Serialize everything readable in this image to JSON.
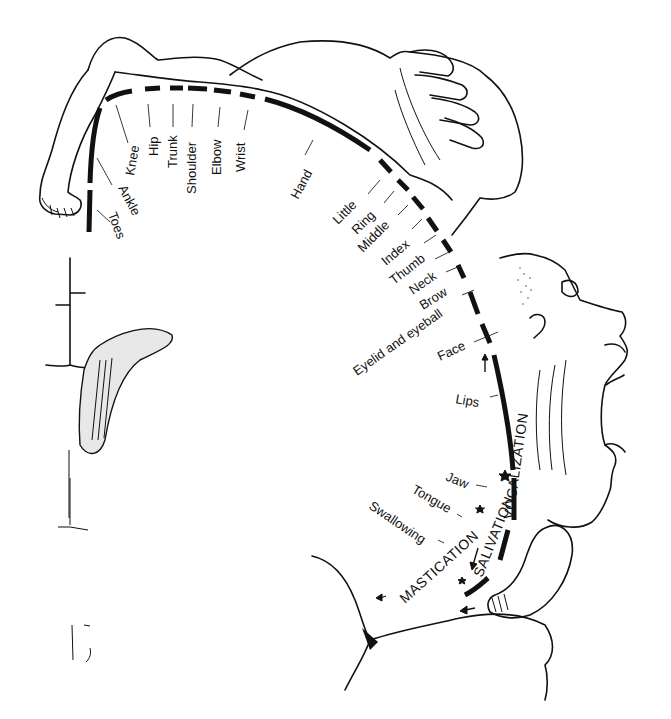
{
  "figure": {
    "colors": {
      "ink": "#111111",
      "background": "#ffffff"
    },
    "body_part_labels": [
      {
        "id": "toes",
        "text": "Toes",
        "x": 118,
        "y": 232,
        "rot": 70
      },
      {
        "id": "ankle",
        "text": "Ankle",
        "x": 130,
        "y": 200,
        "rot": 62
      },
      {
        "id": "knee",
        "text": "Knee",
        "x": 108,
        "y": 160,
        "rot": -80
      },
      {
        "id": "hip",
        "text": "Hip",
        "x": 152,
        "y": 158,
        "rot": -90
      },
      {
        "id": "trunk",
        "text": "Trunk",
        "x": 168,
        "y": 170,
        "rot": -90
      },
      {
        "id": "shoulder",
        "text": "Shoulder",
        "x": 190,
        "y": 190,
        "rot": -90
      },
      {
        "id": "elbow",
        "text": "Elbow",
        "x": 212,
        "y": 175,
        "rot": -90
      },
      {
        "id": "wrist",
        "text": "Wrist",
        "x": 238,
        "y": 170,
        "rot": -90
      },
      {
        "id": "hand",
        "text": "Hand",
        "x": 298,
        "y": 196,
        "rot": -62
      },
      {
        "id": "little",
        "text": "Little",
        "x": 342,
        "y": 224,
        "rot": -45
      },
      {
        "id": "ring",
        "text": "Ring",
        "x": 360,
        "y": 234,
        "rot": -45
      },
      {
        "id": "middle",
        "text": "Middle",
        "x": 368,
        "y": 253,
        "rot": -45
      },
      {
        "id": "index",
        "text": "Index",
        "x": 391,
        "y": 265,
        "rot": -40
      },
      {
        "id": "thumb",
        "text": "Thumb",
        "x": 397,
        "y": 285,
        "rot": -38
      },
      {
        "id": "neck",
        "text": "Neck",
        "x": 417,
        "y": 295,
        "rot": -35
      },
      {
        "id": "brow",
        "text": "Brow",
        "x": 426,
        "y": 310,
        "rot": -32
      },
      {
        "id": "eyelid",
        "text": "Eyelid and eyeball",
        "x": 362,
        "y": 374,
        "rot": -35
      },
      {
        "id": "face",
        "text": "Face",
        "x": 440,
        "y": 360,
        "rot": -25
      },
      {
        "id": "lips",
        "text": "Lips",
        "x": 455,
        "y": 408,
        "rot": 10
      },
      {
        "id": "jaw",
        "text": "Jaw",
        "x": 443,
        "y": 482,
        "rot": 22
      },
      {
        "id": "tongue",
        "text": "Tongue",
        "x": 410,
        "y": 492,
        "rot": 30
      },
      {
        "id": "swallowing",
        "text": "Swallowing",
        "x": 369,
        "y": 510,
        "rot": 34
      }
    ],
    "function_labels": [
      {
        "id": "vocalization",
        "text": "VOCALIZATION",
        "x": 514,
        "y": 512,
        "rot": -80
      },
      {
        "id": "salivation",
        "text": "SALIVATION",
        "x": 480,
        "y": 570,
        "rot": -68
      },
      {
        "id": "mastication",
        "text": "MASTICATION",
        "x": 405,
        "y": 598,
        "rot": -42
      }
    ]
  }
}
